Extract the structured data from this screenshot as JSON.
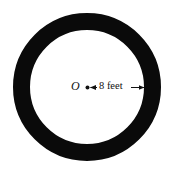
{
  "diagram": {
    "type": "annulus",
    "center_label": "O",
    "dimension_label": "8 feet",
    "ring_color": "#0a0a0a",
    "background_color": "#ffffff",
    "geometry": {
      "center": [
        87,
        87
      ],
      "outer_radius": 74,
      "inner_radius": 57
    }
  }
}
